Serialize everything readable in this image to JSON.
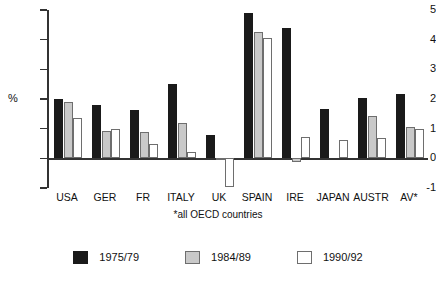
{
  "chart_data": {
    "type": "bar",
    "title": "",
    "subtitle": "",
    "xlabel": "",
    "ylabel": "%",
    "ylim": [
      -1,
      5
    ],
    "yticks": [
      5,
      4,
      3,
      2,
      1,
      0,
      -1
    ],
    "ytick_labels": [
      "5",
      "4",
      "3",
      "2",
      "1",
      "0",
      "-1"
    ],
    "grid": false,
    "legend_position": "bottom",
    "footnote": "*all OECD countries",
    "categories": [
      "USA",
      "GER",
      "FR",
      "ITALY",
      "UK",
      "SPAIN",
      "IRE",
      "JAPAN",
      "AUSTR",
      "AV*"
    ],
    "series": [
      {
        "name": "1975/79",
        "color": "#1a1a1a",
        "values": [
          2.0,
          1.8,
          1.63,
          2.5,
          0.8,
          4.9,
          4.4,
          1.65,
          2.05,
          2.18
        ]
      },
      {
        "name": "1984/89",
        "color": "#c9c9c9",
        "values": [
          1.9,
          0.92,
          0.88,
          1.2,
          -0.06,
          4.25,
          -0.12,
          0.0,
          1.42,
          1.05
        ]
      },
      {
        "name": "1990/92",
        "color": "#ffffff",
        "values": [
          1.35,
          0.98,
          0.5,
          0.22,
          -0.95,
          4.05,
          0.72,
          0.62,
          0.68,
          1.0
        ]
      }
    ]
  }
}
